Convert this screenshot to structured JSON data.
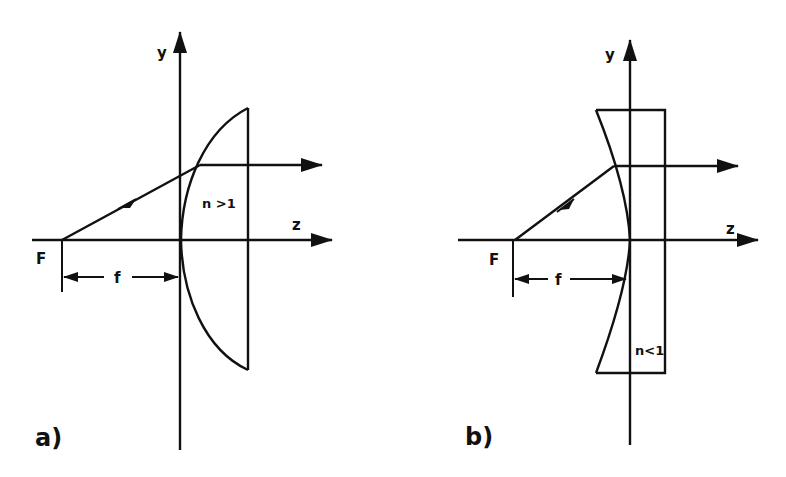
{
  "figure": {
    "panels": [
      {
        "id": "a",
        "label": "a)",
        "y_axis_label": "y",
        "z_axis_label": "z",
        "focus_label": "F",
        "focal_length_label": "f",
        "medium_label": "n >1",
        "lens_type": "plano-convex (hyperbolic surface, n > 1)"
      },
      {
        "id": "b",
        "label": "b)",
        "y_axis_label": "y",
        "z_axis_label": "z",
        "focus_label": "F",
        "focal_length_label": "f",
        "medium_label": "n<1",
        "lens_type": "plano-concave (elliptic surface, n < 1)"
      }
    ],
    "colors": {
      "line": "#111111",
      "background": "#ffffff"
    }
  }
}
